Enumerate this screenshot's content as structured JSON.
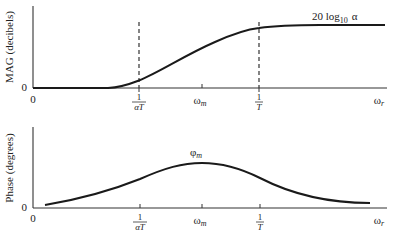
{
  "colors": {
    "curve": "#1a1a1a",
    "axis": "#333333",
    "background": "#ffffff"
  },
  "magnitude_plot": {
    "ylabel": "MAG (decibels)",
    "y_zero": "0",
    "x_zero": "0",
    "asymptote_label": "20 log",
    "asymptote_sub": "10",
    "asymptote_var": "α",
    "ticks": {
      "inv_alpha_T": {
        "num": "1",
        "den": "αT"
      },
      "omega_m": {
        "base": "ω",
        "sub": "m"
      },
      "inv_T": {
        "num": "1",
        "den": "T"
      },
      "omega_r": {
        "base": "ω",
        "sub": "r"
      }
    }
  },
  "phase_plot": {
    "ylabel": "Phase (degrees)",
    "y_zero": "0",
    "x_zero": "0",
    "peak_label": {
      "base": "φ",
      "sub": "m"
    },
    "ticks": {
      "inv_alpha_T": {
        "num": "1",
        "den": "αT"
      },
      "omega_m": {
        "base": "ω",
        "sub": "m"
      },
      "inv_T": {
        "num": "1",
        "den": "T"
      },
      "omega_r": {
        "base": "ω",
        "sub": "r"
      }
    }
  }
}
